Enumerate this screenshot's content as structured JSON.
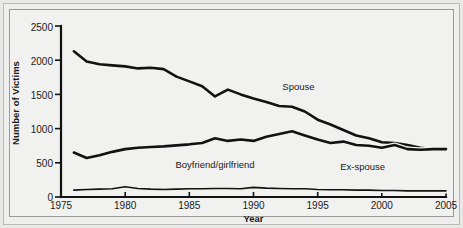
{
  "chart_data": {
    "type": "line",
    "title": "",
    "xlabel": "Year",
    "ylabel": "Number of Victims",
    "xlim": [
      1975,
      2005
    ],
    "ylim": [
      0,
      2500
    ],
    "xticks": [
      1975,
      1980,
      1985,
      1990,
      1995,
      2000,
      2005
    ],
    "yticks": [
      0,
      500,
      1000,
      1500,
      2000,
      2500
    ],
    "grid": false,
    "legend_position": "inline-annotations",
    "x": [
      1976,
      1977,
      1978,
      1979,
      1980,
      1981,
      1982,
      1983,
      1984,
      1985,
      1986,
      1987,
      1988,
      1989,
      1990,
      1991,
      1992,
      1993,
      1994,
      1995,
      1996,
      1997,
      1998,
      1999,
      2000,
      2001,
      2002,
      2003,
      2004,
      2005
    ],
    "series": [
      {
        "name": "Spouse",
        "label": "Spouse",
        "values": [
          2130,
          1980,
          1940,
          1925,
          1910,
          1880,
          1890,
          1870,
          1760,
          1690,
          1620,
          1470,
          1570,
          1500,
          1440,
          1390,
          1330,
          1320,
          1250,
          1130,
          1060,
          980,
          900,
          860,
          800,
          790,
          760,
          720,
          700,
          690
        ]
      },
      {
        "name": "Boyfriend/girlfriend",
        "label": "Boyfriend/girlfriend",
        "values": [
          650,
          570,
          610,
          660,
          700,
          720,
          730,
          740,
          755,
          770,
          790,
          860,
          820,
          840,
          820,
          880,
          920,
          960,
          900,
          840,
          790,
          810,
          760,
          750,
          720,
          760,
          700,
          690,
          700,
          700
        ]
      },
      {
        "name": "Ex-spouse",
        "label": "Ex-spouse",
        "values": [
          100,
          110,
          115,
          120,
          150,
          125,
          115,
          110,
          115,
          120,
          120,
          125,
          125,
          120,
          140,
          130,
          125,
          120,
          120,
          110,
          105,
          105,
          100,
          100,
          95,
          95,
          90,
          90,
          90,
          90
        ]
      }
    ],
    "annotations": [
      {
        "text": "Spouse",
        "x": 1993.5,
        "y": 1560
      },
      {
        "text": "Boyfriend/girlfriend",
        "x": 1987.0,
        "y": 430
      },
      {
        "text": "Ex-spouse",
        "x": 1998.5,
        "y": 400
      }
    ]
  },
  "axes": {
    "y_title": "Number of Victims",
    "x_title": "Year",
    "y_tick_labels": [
      "0",
      "500",
      "1000",
      "1500",
      "2000",
      "2500"
    ],
    "x_tick_labels": [
      "1975",
      "1980",
      "1985",
      "1990",
      "1995",
      "2000",
      "2005"
    ]
  },
  "colors": {
    "line": "#121212",
    "plot_background": "#f1f1ef",
    "frame_background": "#eeeeec",
    "page_background": "#e8e8e6",
    "text": "#1a1a1a"
  }
}
